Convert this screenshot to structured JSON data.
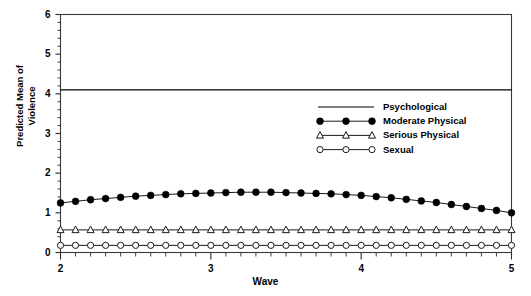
{
  "chart_data": {
    "type": "line",
    "title": "",
    "xlabel": "Wave",
    "ylabel": "Predicted Mean of Violence",
    "ylabel_lines": [
      "Predicted Mean of",
      "Violence"
    ],
    "xlim": [
      2,
      5
    ],
    "ylim": [
      0,
      6
    ],
    "xticks": [
      2,
      3,
      4,
      5
    ],
    "xtick_labels": [
      "2",
      "3",
      "4",
      "5"
    ],
    "xminor_step": 0.1,
    "yticks": [
      0,
      1,
      2,
      3,
      4,
      5,
      6
    ],
    "ytick_labels": [
      "0",
      "1",
      "2",
      "3",
      "4",
      "5",
      "6"
    ],
    "yminor_step": 0.2,
    "grid": false,
    "legend_position": "upper right inside",
    "frame": true,
    "line_color": "#000000",
    "x": [
      2.0,
      2.1,
      2.2,
      2.3,
      2.4,
      2.5,
      2.6,
      2.7,
      2.8,
      2.9,
      3.0,
      3.1,
      3.2,
      3.3,
      3.4,
      3.5,
      3.6,
      3.7,
      3.8,
      3.9,
      4.0,
      4.1,
      4.2,
      4.3,
      4.4,
      4.5,
      4.6,
      4.7,
      4.8,
      4.9,
      5.0
    ],
    "series": [
      {
        "name": "Psychological",
        "marker": "none",
        "values": [
          4.1,
          4.1,
          4.1,
          4.1,
          4.1,
          4.1,
          4.1,
          4.1,
          4.1,
          4.1,
          4.1,
          4.1,
          4.1,
          4.1,
          4.1,
          4.1,
          4.1,
          4.1,
          4.1,
          4.1,
          4.1,
          4.1,
          4.1,
          4.1,
          4.1,
          4.1,
          4.1,
          4.1,
          4.1,
          4.1,
          4.1
        ]
      },
      {
        "name": "Moderate Physical",
        "marker": "filled-circle",
        "values": [
          1.25,
          1.29,
          1.33,
          1.36,
          1.39,
          1.42,
          1.44,
          1.46,
          1.48,
          1.49,
          1.5,
          1.51,
          1.52,
          1.52,
          1.52,
          1.51,
          1.5,
          1.49,
          1.48,
          1.46,
          1.44,
          1.41,
          1.38,
          1.34,
          1.3,
          1.26,
          1.21,
          1.16,
          1.11,
          1.06,
          1.0
        ]
      },
      {
        "name": "Serious Physical",
        "marker": "open-triangle",
        "values": [
          0.57,
          0.57,
          0.57,
          0.57,
          0.57,
          0.57,
          0.57,
          0.57,
          0.57,
          0.57,
          0.57,
          0.57,
          0.57,
          0.57,
          0.57,
          0.57,
          0.57,
          0.57,
          0.57,
          0.57,
          0.57,
          0.57,
          0.57,
          0.57,
          0.57,
          0.57,
          0.57,
          0.57,
          0.57,
          0.57,
          0.57
        ]
      },
      {
        "name": "Sexual",
        "marker": "open-circle",
        "values": [
          0.18,
          0.18,
          0.18,
          0.18,
          0.18,
          0.18,
          0.18,
          0.18,
          0.18,
          0.18,
          0.18,
          0.18,
          0.18,
          0.18,
          0.18,
          0.18,
          0.18,
          0.18,
          0.18,
          0.18,
          0.18,
          0.18,
          0.18,
          0.18,
          0.18,
          0.18,
          0.18,
          0.18,
          0.18,
          0.18,
          0.18
        ]
      }
    ],
    "legend": [
      {
        "label": "Psychological",
        "marker": "none"
      },
      {
        "label": "Moderate Physical",
        "marker": "filled-circle"
      },
      {
        "label": "Serious Physical",
        "marker": "open-triangle"
      },
      {
        "label": "Sexual",
        "marker": "open-circle"
      }
    ]
  }
}
